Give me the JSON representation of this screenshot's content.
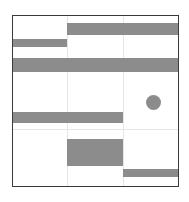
{
  "chart_data": {
    "type": "gantt-like grid of filled rectangles and one circle",
    "title": "",
    "xlabel": "",
    "ylabel": "",
    "grid": true,
    "legend": null,
    "plot_area": {
      "x0": 12,
      "y0": 15,
      "x1": 179,
      "y1": 187
    },
    "columns": 3,
    "grid_lines": {
      "vertical_x": [
        67,
        123
      ],
      "horizontal_y": [
        129
      ]
    },
    "fill_color": "#8c8c8c",
    "shapes": [
      {
        "kind": "rect",
        "name": "top-right-bar",
        "x0": 67,
        "x1": 179,
        "y0": 23,
        "y1": 35
      },
      {
        "kind": "rect",
        "name": "top-left-bar",
        "x0": 12,
        "x1": 67,
        "y0": 39,
        "y1": 47
      },
      {
        "kind": "rect",
        "name": "full-width-bar",
        "x0": 12,
        "x1": 179,
        "y0": 58,
        "y1": 72
      },
      {
        "kind": "rect",
        "name": "middle-left-bar",
        "x0": 12,
        "x1": 123,
        "y0": 112,
        "y1": 123
      },
      {
        "kind": "rect",
        "name": "center-block",
        "x0": 67,
        "x1": 123,
        "y0": 139,
        "y1": 166
      },
      {
        "kind": "rect",
        "name": "bottom-right-bar",
        "x0": 123,
        "x1": 179,
        "y0": 169,
        "y1": 177
      },
      {
        "kind": "circle",
        "name": "dot-marker",
        "cx": 153,
        "cy": 102,
        "r": 7.5
      }
    ]
  },
  "colors": {
    "background": "#ffffff",
    "frame": "#3a3a3a",
    "grid": "#e6e6e6",
    "fill": "#8c8c8c"
  }
}
